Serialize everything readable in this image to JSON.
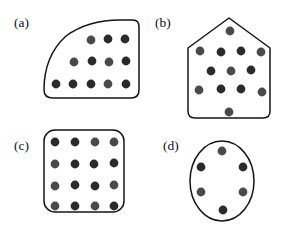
{
  "figure": {
    "background_color": "#ffffff",
    "outline_color": "#141414",
    "label_color": "#111111",
    "dot_color_dark": "#2b2b2b",
    "dot_color_mid": "#4a4a4a",
    "dot_radius": 4.4,
    "width": 284,
    "height": 234
  },
  "panels": [
    {
      "id": "a",
      "label": "(a)",
      "label_x": 14,
      "label_y": 27,
      "shape_type": "d-shape-rounded",
      "dot_count": 13,
      "outline_path": "M 133 20 Q 139 20 139 27 L 139 90 Q 139 98 131 98 L 53 98 Q 44 98 44 90 Q 44 56 66 36 Q 88 20 120 20 Z",
      "dots": [
        {
          "x": 91,
          "y": 40,
          "shade": "mid"
        },
        {
          "x": 108,
          "y": 39,
          "shade": "dark"
        },
        {
          "x": 125,
          "y": 39,
          "shade": "dark"
        },
        {
          "x": 74,
          "y": 62,
          "shade": "mid"
        },
        {
          "x": 92,
          "y": 61,
          "shade": "dark"
        },
        {
          "x": 109,
          "y": 62,
          "shade": "mid"
        },
        {
          "x": 126,
          "y": 61,
          "shade": "dark"
        },
        {
          "x": 56,
          "y": 84,
          "shade": "dark"
        },
        {
          "x": 73,
          "y": 84,
          "shade": "dark"
        },
        {
          "x": 91,
          "y": 84,
          "shade": "dark"
        },
        {
          "x": 108,
          "y": 84,
          "shade": "mid"
        },
        {
          "x": 126,
          "y": 84,
          "shade": "dark"
        }
      ]
    },
    {
      "id": "b",
      "label": "(b)",
      "label_x": 155,
      "label_y": 27,
      "shape_type": "pentagon-house",
      "dot_count": 13,
      "outline_path": "M 229 18 L 270 48 L 270 111 Q 270 118 263 118 L 195 118 Q 188 118 188 111 L 188 48 Z",
      "dots": [
        {
          "x": 230,
          "y": 31,
          "shade": "mid"
        },
        {
          "x": 200,
          "y": 51,
          "shade": "mid"
        },
        {
          "x": 221,
          "y": 52,
          "shade": "dark"
        },
        {
          "x": 241,
          "y": 51,
          "shade": "dark"
        },
        {
          "x": 261,
          "y": 52,
          "shade": "mid"
        },
        {
          "x": 211,
          "y": 71,
          "shade": "dark"
        },
        {
          "x": 231,
          "y": 71,
          "shade": "mid"
        },
        {
          "x": 251,
          "y": 70,
          "shade": "dark"
        },
        {
          "x": 199,
          "y": 90,
          "shade": "mid"
        },
        {
          "x": 221,
          "y": 89,
          "shade": "dark"
        },
        {
          "x": 241,
          "y": 89,
          "shade": "dark"
        },
        {
          "x": 262,
          "y": 92,
          "shade": "mid"
        },
        {
          "x": 229,
          "y": 112,
          "shade": "mid"
        }
      ]
    },
    {
      "id": "c",
      "label": "(c)",
      "label_x": 14,
      "label_y": 150,
      "shape_type": "rounded-square",
      "dot_count": 16,
      "outline_rect": {
        "x": 44,
        "y": 130,
        "width": 80,
        "height": 82,
        "rx": 11
      },
      "dots": [
        {
          "x": 55,
          "y": 142,
          "shade": "dark"
        },
        {
          "x": 75,
          "y": 142,
          "shade": "dark"
        },
        {
          "x": 95,
          "y": 142,
          "shade": "mid"
        },
        {
          "x": 114,
          "y": 142,
          "shade": "mid"
        },
        {
          "x": 55,
          "y": 164,
          "shade": "mid"
        },
        {
          "x": 75,
          "y": 164,
          "shade": "dark"
        },
        {
          "x": 94,
          "y": 164,
          "shade": "dark"
        },
        {
          "x": 114,
          "y": 163,
          "shade": "dark"
        },
        {
          "x": 55,
          "y": 186,
          "shade": "mid"
        },
        {
          "x": 75,
          "y": 185,
          "shade": "dark"
        },
        {
          "x": 95,
          "y": 186,
          "shade": "dark"
        },
        {
          "x": 114,
          "y": 185,
          "shade": "mid"
        },
        {
          "x": 55,
          "y": 206,
          "shade": "mid"
        },
        {
          "x": 75,
          "y": 206,
          "shade": "dark"
        },
        {
          "x": 95,
          "y": 206,
          "shade": "mid"
        },
        {
          "x": 114,
          "y": 206,
          "shade": "dark"
        }
      ]
    },
    {
      "id": "d",
      "label": "(d)",
      "label_x": 163,
      "label_y": 150,
      "shape_type": "ellipse",
      "dot_count": 6,
      "outline_ellipse": {
        "cx": 222,
        "cy": 181,
        "rx": 32,
        "ry": 40
      },
      "dots": [
        {
          "x": 222,
          "y": 151,
          "shade": "mid"
        },
        {
          "x": 201,
          "y": 167,
          "shade": "dark"
        },
        {
          "x": 243,
          "y": 167,
          "shade": "dark"
        },
        {
          "x": 201,
          "y": 192,
          "shade": "mid"
        },
        {
          "x": 243,
          "y": 192,
          "shade": "mid"
        },
        {
          "x": 223,
          "y": 210,
          "shade": "dark"
        }
      ]
    }
  ]
}
